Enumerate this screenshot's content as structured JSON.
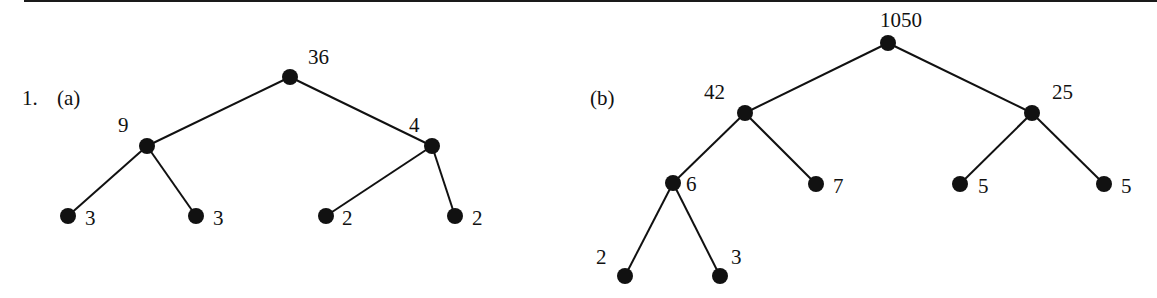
{
  "problem_number": "1.",
  "trees": [
    {
      "label": "(a)",
      "label_pos": [
        57,
        105
      ],
      "nodes": [
        {
          "id": "a0",
          "value": "36",
          "x": 290,
          "y": 77,
          "lx": 308,
          "ly": 64,
          "anchor": "start"
        },
        {
          "id": "a1",
          "value": "9",
          "x": 147,
          "y": 146,
          "lx": 118,
          "ly": 132,
          "anchor": "start"
        },
        {
          "id": "a2",
          "value": "4",
          "x": 432,
          "y": 146,
          "lx": 409,
          "ly": 132,
          "anchor": "start"
        },
        {
          "id": "a3",
          "value": "3",
          "x": 68,
          "y": 216,
          "lx": 85,
          "ly": 225,
          "anchor": "start"
        },
        {
          "id": "a4",
          "value": "3",
          "x": 196,
          "y": 216,
          "lx": 213,
          "ly": 225,
          "anchor": "start"
        },
        {
          "id": "a5",
          "value": "2",
          "x": 326,
          "y": 216,
          "lx": 342,
          "ly": 225,
          "anchor": "start"
        },
        {
          "id": "a6",
          "value": "2",
          "x": 455,
          "y": 216,
          "lx": 472,
          "ly": 225,
          "anchor": "start"
        }
      ],
      "edges": [
        [
          "a0",
          "a1"
        ],
        [
          "a0",
          "a2"
        ],
        [
          "a1",
          "a3"
        ],
        [
          "a1",
          "a4"
        ],
        [
          "a2",
          "a5"
        ],
        [
          "a2",
          "a6"
        ]
      ]
    },
    {
      "label": "(b)",
      "label_pos": [
        590,
        105
      ],
      "nodes": [
        {
          "id": "b0",
          "value": "1050",
          "x": 888,
          "y": 43,
          "lx": 880,
          "ly": 27,
          "anchor": "start"
        },
        {
          "id": "b1",
          "value": "42",
          "x": 745,
          "y": 113,
          "lx": 704,
          "ly": 99,
          "anchor": "start"
        },
        {
          "id": "b2",
          "value": "25",
          "x": 1032,
          "y": 113,
          "lx": 1052,
          "ly": 99,
          "anchor": "start"
        },
        {
          "id": "b3",
          "value": "6",
          "x": 673,
          "y": 183,
          "lx": 686,
          "ly": 191,
          "anchor": "start"
        },
        {
          "id": "b4",
          "value": "7",
          "x": 816,
          "y": 184,
          "lx": 833,
          "ly": 193,
          "anchor": "start"
        },
        {
          "id": "b5",
          "value": "5",
          "x": 960,
          "y": 184,
          "lx": 978,
          "ly": 193,
          "anchor": "start"
        },
        {
          "id": "b6",
          "value": "5",
          "x": 1104,
          "y": 184,
          "lx": 1121,
          "ly": 193,
          "anchor": "start"
        },
        {
          "id": "b7",
          "value": "2",
          "x": 625,
          "y": 276,
          "lx": 596,
          "ly": 264,
          "anchor": "start"
        },
        {
          "id": "b8",
          "value": "3",
          "x": 720,
          "y": 276,
          "lx": 731,
          "ly": 264,
          "anchor": "start"
        }
      ],
      "edges": [
        [
          "b0",
          "b1"
        ],
        [
          "b0",
          "b2"
        ],
        [
          "b1",
          "b3"
        ],
        [
          "b1",
          "b4"
        ],
        [
          "b2",
          "b5"
        ],
        [
          "b2",
          "b6"
        ],
        [
          "b3",
          "b7"
        ],
        [
          "b3",
          "b8"
        ]
      ]
    }
  ]
}
